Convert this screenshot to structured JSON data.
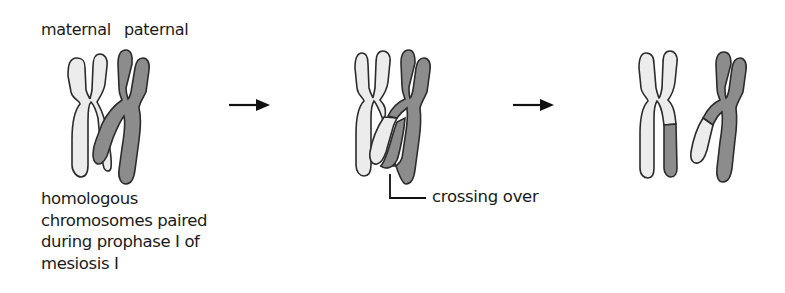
{
  "labels": {
    "maternal": "maternal",
    "paternal": "paternal",
    "crossing_over": "crossing over"
  },
  "caption": {
    "lines": [
      "homologous",
      "chromosomes paired",
      "during prophase I of",
      "mesiosis I"
    ]
  },
  "stages": [
    {
      "name": "homologous pair",
      "description": "maternal (light) and paternal (dark) chromosomes paired"
    },
    {
      "name": "crossing over",
      "description": "non-sister chromatids overlap and exchange segments"
    },
    {
      "name": "recombinant chromosomes",
      "description": "separated chromosomes carrying exchanged segments"
    }
  ],
  "colors": {
    "maternal": "#ececec",
    "paternal": "#8c8c8c",
    "outline": "#2b2b2b",
    "arrow": "#111111"
  }
}
